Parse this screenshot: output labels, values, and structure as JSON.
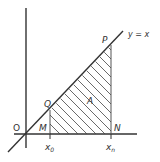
{
  "diagram": {
    "line_label": "y = x",
    "origin_label": "O",
    "points": {
      "P": "P",
      "Q": "Q",
      "M": "M",
      "N": "N"
    },
    "region_label": "A",
    "x_ticks": {
      "x0": "x",
      "x0_sub": "0",
      "xn": "x",
      "xn_sub": "n"
    },
    "colors": {
      "ink": "#333333",
      "hatch": "#444444",
      "background": "#ffffff"
    }
  }
}
